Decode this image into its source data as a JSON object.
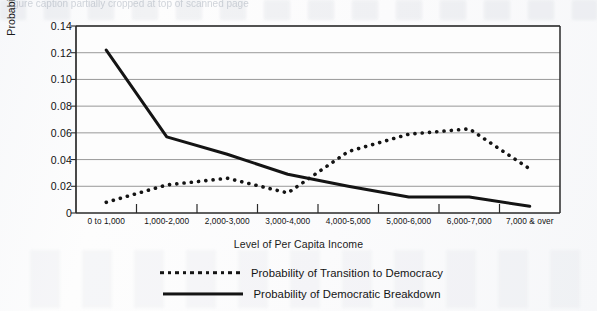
{
  "page": {
    "caption_ghost": "figure caption partially cropped at top of scanned page"
  },
  "chart_data": {
    "type": "line",
    "title": "",
    "xlabel": "Level of Per Capita Income",
    "ylabel": "Probability of Regime Transition",
    "categories": [
      "0 to 1,000",
      "1,000-2,000",
      "2,000-3,000",
      "3,000-4,000",
      "4,000-5,000",
      "5,000-6,000",
      "6,000-7,000",
      "7,000 & over"
    ],
    "ylim": [
      0,
      0.14
    ],
    "yticks": [
      0,
      0.02,
      0.04,
      0.06,
      0.08,
      0.1,
      0.12,
      0.14
    ],
    "ytick_labels": [
      "0",
      "0.02",
      "0.04",
      "0.06",
      "0.08",
      "0.10",
      "0.12",
      "0.14"
    ],
    "grid": "horizontal",
    "legend_position": "below",
    "series": [
      {
        "name": "Probability of Transition to Democracy",
        "style": "dotted",
        "color": "#141414",
        "values": [
          0.008,
          0.021,
          0.026,
          0.015,
          0.046,
          0.059,
          0.063,
          0.033
        ]
      },
      {
        "name": "Probability of Democratic Breakdown",
        "style": "solid",
        "color": "#141414",
        "values": [
          0.122,
          0.057,
          0.044,
          0.029,
          0.02,
          0.012,
          0.012,
          0.005
        ]
      }
    ]
  },
  "axis_style": {
    "gridline_color": "#8d8d8d",
    "frame_color": "#2a2a2a",
    "plot_background": "#fdfdfd"
  }
}
